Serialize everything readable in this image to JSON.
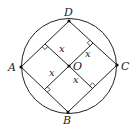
{
  "figure": {
    "circle": {
      "cx": 69,
      "cy": 66,
      "r": 47.5,
      "color": "#222222"
    },
    "points": {
      "A": {
        "label": "A",
        "x": 21,
        "y": 67
      },
      "B": {
        "label": "B",
        "x": 68,
        "y": 112
      },
      "C": {
        "label": "C",
        "x": 117,
        "y": 65
      },
      "D": {
        "label": "D",
        "x": 69,
        "y": 21
      },
      "O": {
        "label": "O",
        "x": 69,
        "y": 66
      }
    },
    "segment_labels": {
      "o_to_ad": "x",
      "o_to_dc": "x",
      "o_to_ab": "x",
      "o_to_cb": "x"
    }
  }
}
